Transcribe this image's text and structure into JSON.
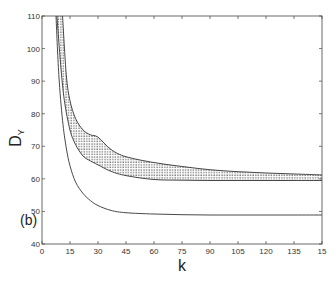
{
  "chart_data": {
    "type": "line",
    "title": "",
    "panel_label": "(b)",
    "xlabel": "k",
    "ylabel": "D",
    "ylabel_subscript": "Y",
    "xlim": [
      0,
      150
    ],
    "ylim": [
      40,
      110
    ],
    "x_ticks": [
      0,
      15,
      30,
      45,
      60,
      75,
      90,
      105,
      120,
      135,
      150
    ],
    "x_tick_labels": [
      "0",
      "15",
      "30",
      "45",
      "60",
      "75",
      "90",
      "105",
      "120",
      "135",
      "15"
    ],
    "y_ticks": [
      40,
      50,
      60,
      70,
      80,
      90,
      100,
      110
    ],
    "y_tick_labels": [
      "40",
      "50",
      "60",
      "70",
      "80",
      "90",
      "100",
      "110"
    ],
    "grid": false,
    "legend": null,
    "series": [
      {
        "name": "band upper bound",
        "style": "solid",
        "x": [
          11,
          13,
          15,
          18,
          22,
          26,
          30,
          37,
          45,
          60,
          75,
          90,
          105,
          120,
          135,
          150
        ],
        "values": [
          110,
          92,
          84,
          78.5,
          75,
          73.5,
          72.8,
          69,
          66.8,
          65,
          63.8,
          62.8,
          62.2,
          61.8,
          61.5,
          61.2
        ]
      },
      {
        "name": "band lower bound",
        "style": "solid",
        "x": [
          8,
          10,
          12,
          15,
          18,
          22,
          26,
          30,
          37,
          45,
          60,
          75,
          90,
          105,
          120,
          135,
          150
        ],
        "values": [
          110,
          95,
          84,
          75,
          70.5,
          67,
          65.5,
          64.3,
          62.3,
          61,
          59.8,
          59.6,
          59.5,
          59.5,
          59.5,
          59.5,
          59.5
        ]
      },
      {
        "name": "lower curve",
        "style": "solid",
        "x": [
          7.5,
          9,
          11,
          13,
          15,
          18,
          22,
          26,
          30,
          37,
          45,
          60,
          75,
          90,
          105,
          120,
          135,
          150
        ],
        "values": [
          110,
          92,
          78,
          69.5,
          64,
          59,
          55.5,
          53.3,
          51.8,
          50.3,
          49.6,
          49.2,
          49.0,
          48.9,
          48.9,
          48.9,
          48.9,
          48.9
        ]
      }
    ],
    "shaded_region": {
      "between": [
        "band upper bound",
        "band lower bound"
      ],
      "pattern": "dotted"
    }
  }
}
